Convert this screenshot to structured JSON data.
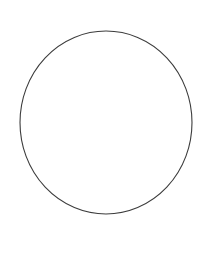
{
  "canvas": {
    "width": 215,
    "height": 261,
    "background_color": "#ffffff",
    "content_description": "blank white image containing a single thin dark outlined circle"
  },
  "figure": {
    "name": "circle-outline",
    "shape": "circle",
    "fill": "none",
    "stroke_color": "#3c3c3c",
    "stroke_width": 1.1,
    "center_x": 106,
    "center_y": 122.5,
    "radius_x": 86,
    "radius_y": 91.5,
    "bounds": {
      "left": 20,
      "top": 31,
      "right": 192,
      "bottom": 214,
      "width": 172,
      "height": 183
    }
  },
  "chart_data": {
    "type": "scatter",
    "title": "",
    "subtitle": "",
    "xlabel": "",
    "ylabel": "",
    "grid": false,
    "legend": [],
    "annotations": [],
    "shapes": [
      {
        "kind": "ellipse",
        "label": "circle-outline",
        "cx": 106,
        "cy": 122.5,
        "rx": 86,
        "ry": 91.5,
        "fill": "none",
        "stroke": "#3c3c3c",
        "stroke_width": 1.1
      }
    ],
    "x": [],
    "values": []
  }
}
